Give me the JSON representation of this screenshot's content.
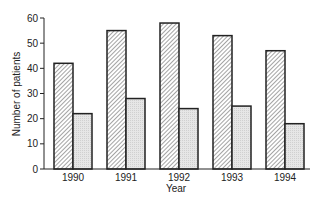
{
  "chart_data": {
    "type": "bar",
    "title": "",
    "xlabel": "Year",
    "ylabel": "Number of patients",
    "categories": [
      "1990",
      "1991",
      "1992",
      "1993",
      "1994"
    ],
    "series": [
      {
        "name": "Series A (hatched)",
        "values": [
          42,
          55,
          58,
          53,
          47
        ],
        "pattern": "diagonal-hatch"
      },
      {
        "name": "Series B (dotted)",
        "values": [
          22,
          28,
          24,
          25,
          18
        ],
        "pattern": "light-stipple"
      }
    ],
    "ylim": [
      0,
      60
    ],
    "yticks": [
      0,
      10,
      20,
      30,
      40,
      50,
      60
    ],
    "grid": false,
    "legend": "none"
  },
  "colors": {
    "outline": "#222222",
    "hatch": "#555555",
    "stipple": "#e2e2e2"
  }
}
